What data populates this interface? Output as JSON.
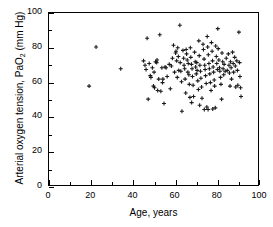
{
  "chart_data": {
    "type": "scatter",
    "title": "",
    "xlabel": "Age, years",
    "ylabel_parts": {
      "pre": "Arterial oxygen tension, PaO",
      "sub": "2",
      "post": " (mm Hg)"
    },
    "ylabel": "Arterial oxygen tension, PaO2 (mm Hg)",
    "xlim": [
      0,
      100
    ],
    "ylim": [
      0,
      100
    ],
    "xticks": [
      0,
      20,
      40,
      60,
      80,
      100
    ],
    "yticks": [
      0,
      20,
      40,
      60,
      80,
      100
    ],
    "xticks_minor": [
      10,
      30,
      50,
      70,
      90
    ],
    "yticks_minor": [
      10,
      30,
      50,
      70,
      90
    ],
    "xticklabels": [
      "0",
      "20",
      "40",
      "60",
      "80",
      "100"
    ],
    "yticklabels": [
      "0",
      "20",
      "40",
      "60",
      "80",
      "100"
    ],
    "grid": false,
    "legend": null,
    "marker": "plus",
    "marker_color": "#1a1a1a",
    "marker_size": 4,
    "n_points": 151,
    "points": [
      [
        19.0,
        58.0
      ],
      [
        22.3,
        80.5
      ],
      [
        34.0,
        68.0
      ],
      [
        44.8,
        72.5
      ],
      [
        45.5,
        70.0
      ],
      [
        46.0,
        67.5
      ],
      [
        46.5,
        85.5
      ],
      [
        47.0,
        50.5
      ],
      [
        47.5,
        71.0
      ],
      [
        48.0,
        64.0
      ],
      [
        48.3,
        63.0
      ],
      [
        49.0,
        68.5
      ],
      [
        49.5,
        58.0
      ],
      [
        50.0,
        57.0
      ],
      [
        50.5,
        72.0
      ],
      [
        51.0,
        71.5
      ],
      [
        51.2,
        73.0
      ],
      [
        51.5,
        55.5
      ],
      [
        52.0,
        62.0
      ],
      [
        52.5,
        87.5
      ],
      [
        53.0,
        55.0
      ],
      [
        53.5,
        68.5
      ],
      [
        54.0,
        62.0
      ],
      [
        54.5,
        48.0
      ],
      [
        55.0,
        69.0
      ],
      [
        55.5,
        68.5
      ],
      [
        56.0,
        63.5
      ],
      [
        57.0,
        70.5
      ],
      [
        58.0,
        69.5
      ],
      [
        58.5,
        74.0
      ],
      [
        59.0,
        81.5
      ],
      [
        59.5,
        66.0
      ],
      [
        60.0,
        77.0
      ],
      [
        60.2,
        78.0
      ],
      [
        60.5,
        72.5
      ],
      [
        60.8,
        63.0
      ],
      [
        61.0,
        80.0
      ],
      [
        61.3,
        75.0
      ],
      [
        61.5,
        67.0
      ],
      [
        62.0,
        93.0
      ],
      [
        62.2,
        71.5
      ],
      [
        62.5,
        66.5
      ],
      [
        62.8,
        60.5
      ],
      [
        63.0,
        43.5
      ],
      [
        63.5,
        78.5
      ],
      [
        63.8,
        74.0
      ],
      [
        64.0,
        70.0
      ],
      [
        64.3,
        68.0
      ],
      [
        64.5,
        62.0
      ],
      [
        65.0,
        79.0
      ],
      [
        65.2,
        76.5
      ],
      [
        65.5,
        73.0
      ],
      [
        65.8,
        66.0
      ],
      [
        66.0,
        71.0
      ],
      [
        66.3,
        64.5
      ],
      [
        66.5,
        59.0
      ],
      [
        66.8,
        51.5
      ],
      [
        67.0,
        80.0
      ],
      [
        67.2,
        74.5
      ],
      [
        67.5,
        70.5
      ],
      [
        67.8,
        68.0
      ],
      [
        68.0,
        63.5
      ],
      [
        68.3,
        58.5
      ],
      [
        68.5,
        52.0
      ],
      [
        69.0,
        77.5
      ],
      [
        69.3,
        72.0
      ],
      [
        69.5,
        69.0
      ],
      [
        69.8,
        65.0
      ],
      [
        70.0,
        71.5
      ],
      [
        70.2,
        67.0
      ],
      [
        70.5,
        61.0
      ],
      [
        70.8,
        56.0
      ],
      [
        71.0,
        84.0
      ],
      [
        71.2,
        75.5
      ],
      [
        71.5,
        70.0
      ],
      [
        71.8,
        66.5
      ],
      [
        72.0,
        62.5
      ],
      [
        72.3,
        57.5
      ],
      [
        72.5,
        51.0
      ],
      [
        73.0,
        82.0
      ],
      [
        73.2,
        79.0
      ],
      [
        73.5,
        73.5
      ],
      [
        73.8,
        70.0
      ],
      [
        74.0,
        67.5
      ],
      [
        74.2,
        64.0
      ],
      [
        74.5,
        59.5
      ],
      [
        74.8,
        46.0
      ],
      [
        75.0,
        86.5
      ],
      [
        75.2,
        80.5
      ],
      [
        75.5,
        76.0
      ],
      [
        75.8,
        71.0
      ],
      [
        76.0,
        68.0
      ],
      [
        76.2,
        65.0
      ],
      [
        76.5,
        60.0
      ],
      [
        76.8,
        55.5
      ],
      [
        77.0,
        83.0
      ],
      [
        77.3,
        78.0
      ],
      [
        77.5,
        72.5
      ],
      [
        77.8,
        69.0
      ],
      [
        78.0,
        66.0
      ],
      [
        78.3,
        61.5
      ],
      [
        78.5,
        58.0
      ],
      [
        78.8,
        45.5
      ],
      [
        79.0,
        81.0
      ],
      [
        79.3,
        75.0
      ],
      [
        79.5,
        71.0
      ],
      [
        79.8,
        67.5
      ],
      [
        80.0,
        91.0
      ],
      [
        80.2,
        79.5
      ],
      [
        80.5,
        73.0
      ],
      [
        80.8,
        68.5
      ],
      [
        81.0,
        66.5
      ],
      [
        81.3,
        63.0
      ],
      [
        81.5,
        59.0
      ],
      [
        81.8,
        50.5
      ],
      [
        82.0,
        77.0
      ],
      [
        82.3,
        72.0
      ],
      [
        82.5,
        68.0
      ],
      [
        82.8,
        64.5
      ],
      [
        83.0,
        70.5
      ],
      [
        83.5,
        66.5
      ],
      [
        84.0,
        74.0
      ],
      [
        84.5,
        67.0
      ],
      [
        85.0,
        76.5
      ],
      [
        85.3,
        70.0
      ],
      [
        85.5,
        65.5
      ],
      [
        85.8,
        58.0
      ],
      [
        86.0,
        72.0
      ],
      [
        86.3,
        68.5
      ],
      [
        86.5,
        62.0
      ],
      [
        87.0,
        77.5
      ],
      [
        87.3,
        71.0
      ],
      [
        87.5,
        66.0
      ],
      [
        88.0,
        74.5
      ],
      [
        88.3,
        69.5
      ],
      [
        88.5,
        57.5
      ],
      [
        89.0,
        72.5
      ],
      [
        89.3,
        67.0
      ],
      [
        89.5,
        58.5
      ],
      [
        90.0,
        89.0
      ],
      [
        90.3,
        71.5
      ],
      [
        90.5,
        63.5
      ],
      [
        90.8,
        57.0
      ],
      [
        91.0,
        52.0
      ],
      [
        57.5,
        56.5
      ],
      [
        53.8,
        60.0
      ],
      [
        49.8,
        66.0
      ],
      [
        64.8,
        54.0
      ],
      [
        73.6,
        44.5
      ],
      [
        75.4,
        44.5
      ],
      [
        77.6,
        44.8
      ],
      [
        67.6,
        48.5
      ],
      [
        71.4,
        47.0
      ]
    ]
  }
}
